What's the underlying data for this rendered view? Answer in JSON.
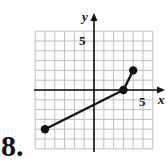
{
  "problem": {
    "number_label": "8."
  },
  "chart_data": {
    "type": "line",
    "title": "",
    "xlabel": "x",
    "ylabel": "y",
    "xlim": [
      -6,
      6
    ],
    "ylim": [
      -6,
      6
    ],
    "grid": true,
    "tick_labels": {
      "x": [
        "5"
      ],
      "y": [
        "5"
      ]
    },
    "series": [
      {
        "name": "piecewise segments",
        "points": [
          [
            -5,
            -4
          ],
          [
            3,
            0
          ],
          [
            4,
            2
          ]
        ],
        "endpoints_closed": true
      }
    ]
  },
  "colors": {
    "grid": "#b8b8b8",
    "axis": "#111111",
    "line": "#111111",
    "background": "#ffffff"
  }
}
